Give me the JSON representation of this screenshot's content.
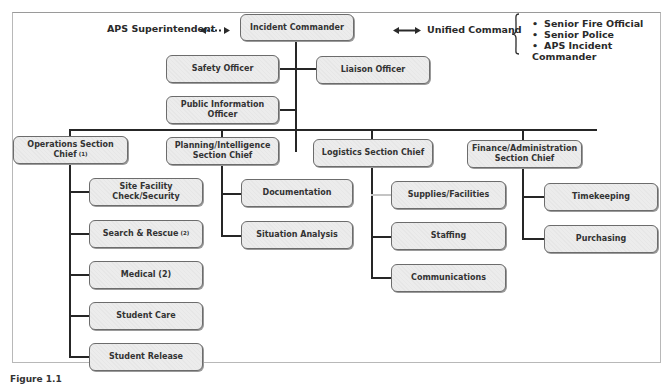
{
  "diagram": {
    "type": "incident-command-org-chart",
    "header": {
      "left_label": "APS Superintendent",
      "left_connector": "dotted-double-arrow",
      "right_label": "Unified Command",
      "right_connector": "solid-double-arrow",
      "unified_command_members": [
        "Senior Fire Official",
        "Senior Police",
        "APS Incident Commander"
      ]
    },
    "command": {
      "incident_commander": "Incident Commander",
      "staff": {
        "safety": "Safety Officer",
        "liaison": "Liaison Officer",
        "pio": "Public Information Officer"
      }
    },
    "sections": [
      {
        "title": "Operations Section Chief",
        "note": "(1)",
        "units": [
          {
            "label": "Site Facility Check/Security",
            "note": ""
          },
          {
            "label": "Search & Rescue",
            "note": "(2)"
          },
          {
            "label": "Medical (2)",
            "note": ""
          },
          {
            "label": "Student Care",
            "note": ""
          },
          {
            "label": "Student Release",
            "note": ""
          }
        ]
      },
      {
        "title_line1": "Planning/Intelligence",
        "title_line2": "Section Chief",
        "units": [
          {
            "label": "Documentation"
          },
          {
            "label": "Situation Analysis"
          }
        ]
      },
      {
        "title": "Logistics Section Chief",
        "units": [
          {
            "label": "Supplies/Facilities"
          },
          {
            "label": "Staffing"
          },
          {
            "label": "Communications"
          }
        ]
      },
      {
        "title_line1": "Finance/Administration",
        "title_line2": "Section Chief",
        "units": [
          {
            "label": "Timekeeping"
          },
          {
            "label": "Purchasing"
          }
        ]
      }
    ],
    "caption": "Figure 1.1"
  },
  "colors": {
    "box_fill": "#ececec",
    "box_border": "#6c6c6c",
    "line": "#262626",
    "text": "#2a2a2a"
  }
}
